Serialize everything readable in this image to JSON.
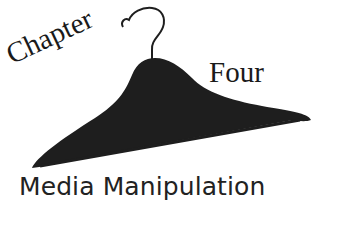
{
  "title": {
    "chapter_word": "Chapter",
    "number_word": "Four",
    "subtitle": "Media Manipulation"
  },
  "graphic": {
    "icon": "clothes-hanger-icon",
    "color": "#1e1e1e"
  }
}
